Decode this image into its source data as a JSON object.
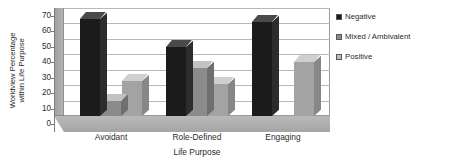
{
  "chart_data": {
    "type": "bar",
    "title": "",
    "categories": [
      "Avoidant",
      "Role-Defined",
      "Engaging"
    ],
    "series": [
      {
        "name": "Negative",
        "color": "#1b1b1b",
        "values": [
          63,
          45,
          61
        ]
      },
      {
        "name": "Mixed / Ambivalent",
        "color": "#8b8b8b",
        "values": [
          10,
          31,
          0
        ]
      },
      {
        "name": "Positive",
        "color": "#a3a3a3",
        "values": [
          23,
          21,
          35
        ]
      }
    ],
    "xlabel": "Life Purpose",
    "ylabel": "Worldview Percentage within Life Purpose",
    "ylim": [
      0,
      70
    ],
    "ytick_step": 10,
    "yticks": [
      "70",
      "60",
      "50",
      "40",
      "30",
      "20",
      "10",
      "0"
    ],
    "grid": true,
    "legend_position": "right",
    "style": "3d-column"
  },
  "axis": {
    "y_title_line1": "Worldview Percentage",
    "y_title_line2": "within Life Purpose",
    "x_title": "Life Purpose"
  },
  "legend": {
    "items": [
      {
        "label": "Negative"
      },
      {
        "label": "Mixed / Ambivalent"
      },
      {
        "label": "Positive"
      }
    ]
  }
}
